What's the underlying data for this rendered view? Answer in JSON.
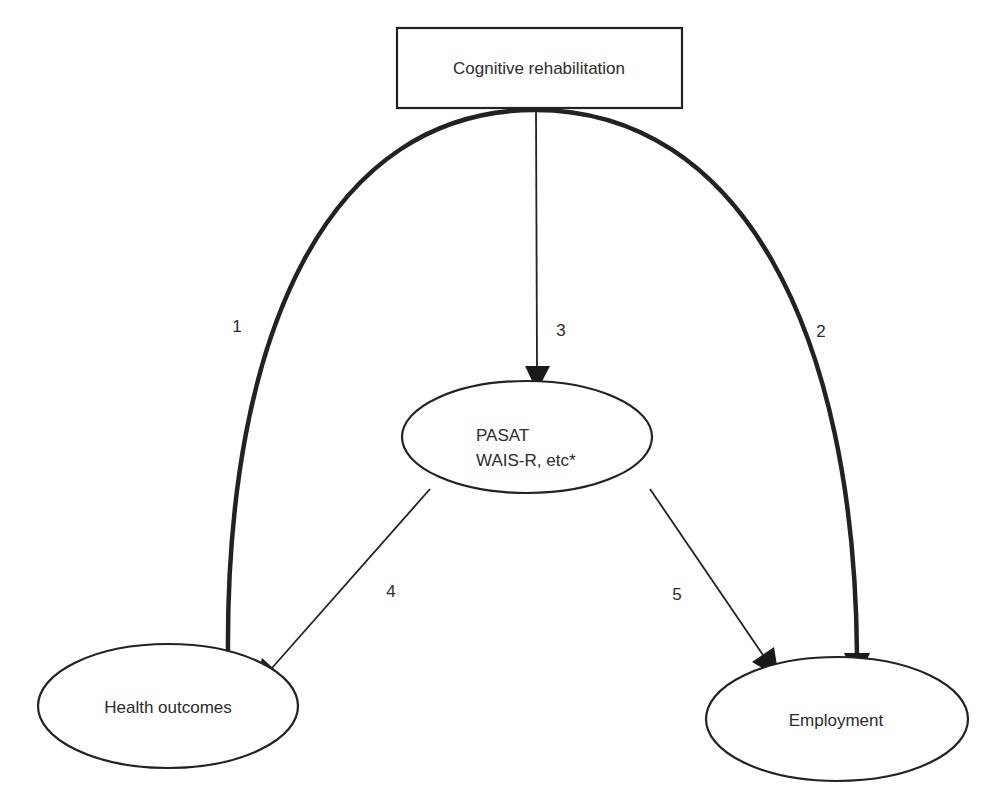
{
  "diagram": {
    "type": "path-diagram",
    "nodes": {
      "cognitive_rehabilitation": {
        "label": "Cognitive rehabilitation",
        "shape": "rectangle"
      },
      "pasat": {
        "label_line1": "PASAT",
        "label_line2": "WAIS-R, etc*",
        "shape": "ellipse"
      },
      "health_outcomes": {
        "label": "Health outcomes",
        "shape": "ellipse"
      },
      "employment": {
        "label": "Employment",
        "shape": "ellipse"
      }
    },
    "edges": [
      {
        "id": "1",
        "label": "1",
        "from": "Cognitive rehabilitation",
        "to": "Health outcomes",
        "style": "thick-curved"
      },
      {
        "id": "2",
        "label": "2",
        "from": "Cognitive rehabilitation",
        "to": "Employment",
        "style": "thick-curved"
      },
      {
        "id": "3",
        "label": "3",
        "from": "Cognitive rehabilitation",
        "to": "PASAT / WAIS-R, etc*",
        "style": "thin-straight"
      },
      {
        "id": "4",
        "label": "4",
        "from": "PASAT / WAIS-R, etc*",
        "to": "Health outcomes",
        "style": "thin-straight"
      },
      {
        "id": "5",
        "label": "5",
        "from": "PASAT / WAIS-R, etc*",
        "to": "Employment",
        "style": "thin-straight"
      }
    ],
    "colors": {
      "stroke": "#222222",
      "background": "#ffffff",
      "text": "#2b2b2b"
    }
  }
}
